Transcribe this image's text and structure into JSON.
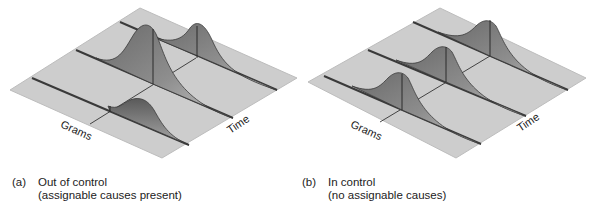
{
  "panels": [
    {
      "id": "a",
      "tag": "(a)",
      "title": "Out of control",
      "subtitle": "(assignable causes present)",
      "x_axis_label": "Grams",
      "time_axis_label": "Time",
      "distributions": [
        {
          "position": "front",
          "height": "low",
          "shift": "right"
        },
        {
          "position": "middle",
          "height": "tall",
          "shift": "right"
        },
        {
          "position": "back",
          "height": "medium",
          "shift": "right"
        }
      ]
    },
    {
      "id": "b",
      "tag": "(b)",
      "title": "In control",
      "subtitle": "(no assignable causes)",
      "x_axis_label": "Grams",
      "time_axis_label": "Time",
      "distributions": [
        {
          "position": "front",
          "height": "medium",
          "shift": "none"
        },
        {
          "position": "middle",
          "height": "medium",
          "shift": "none"
        },
        {
          "position": "back",
          "height": "medium",
          "shift": "none"
        }
      ]
    }
  ],
  "colors": {
    "plane": "#cfcfcf",
    "plane_edge": "#b8b8b8",
    "rail": "#3a3a3a",
    "curve_dark": "#4a4a4a",
    "curve_light": "#b5b5b5",
    "text": "#222222"
  }
}
